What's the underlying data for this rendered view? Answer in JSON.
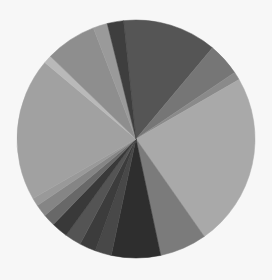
{
  "chart_data": {
    "type": "pie",
    "title": "",
    "legend": null,
    "center": [
      136,
      139
    ],
    "radius": 119,
    "start_angle_deg": 354,
    "direction": "clockwise",
    "unit": "degrees",
    "slices": [
      {
        "label": "",
        "value": 46,
        "color": "#555555"
      },
      {
        "label": "",
        "value": 16,
        "color": "#767676"
      },
      {
        "label": "",
        "value": 4,
        "color": "#8a8a8a"
      },
      {
        "label": "",
        "value": 85,
        "color": "#a9a9a9"
      },
      {
        "label": "",
        "value": 23,
        "color": "#7b7b7b"
      },
      {
        "label": "",
        "value": 24,
        "color": "#2e2e2e"
      },
      {
        "label": "",
        "value": 8,
        "color": "#484848"
      },
      {
        "label": "",
        "value": 8,
        "color": "#3c3c3c"
      },
      {
        "label": "",
        "value": 8,
        "color": "#545454"
      },
      {
        "label": "",
        "value": 8,
        "color": "#393939"
      },
      {
        "label": "",
        "value": 6,
        "color": "#686868"
      },
      {
        "label": "",
        "value": 6,
        "color": "#858585"
      },
      {
        "label": "",
        "value": 4,
        "color": "#999999"
      },
      {
        "label": "",
        "value": 70,
        "color": "#a1a1a1"
      },
      {
        "label": "",
        "value": 4,
        "color": "#b9b9b9"
      },
      {
        "label": "",
        "value": 25,
        "color": "#8e8e8e"
      },
      {
        "label": "",
        "value": 7,
        "color": "#9a9a9a"
      },
      {
        "label": "",
        "value": 8,
        "color": "#3e3e3e"
      }
    ]
  }
}
